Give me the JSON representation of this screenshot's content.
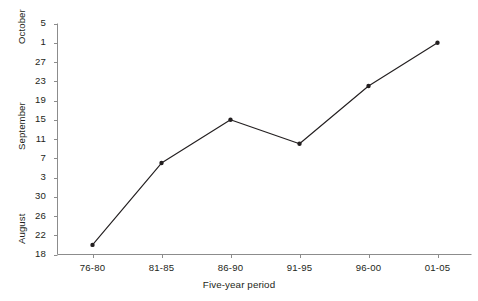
{
  "caption_clipped": "                                                                                                                    ",
  "axes": {
    "y_group_labels": [
      {
        "name": "October",
        "top": 44,
        "left": 16
      },
      {
        "name": "September",
        "top": 150,
        "left": 16
      },
      {
        "name": "August",
        "top": 244,
        "left": 16
      }
    ],
    "y_tick_labels": [
      "5",
      "1",
      "27",
      "23",
      "19",
      "15",
      "11",
      "7",
      "3",
      "30",
      "26",
      "22",
      "18"
    ],
    "x_tick_labels": [
      "76-80",
      "81-85",
      "86-90",
      "91-95",
      "96-00",
      "01-05"
    ],
    "x_title": "Five-year period",
    "y_title": ""
  },
  "chart_data": {
    "type": "line",
    "title": "",
    "subtitle": "",
    "xlabel": "Five-year period",
    "ylabel": "",
    "categories": [
      "76-80",
      "81-85",
      "86-90",
      "91-95",
      "96-00",
      "01-05"
    ],
    "y_tick_labels": [
      "5",
      "1",
      "27",
      "23",
      "19",
      "15",
      "11",
      "7",
      "3",
      "30",
      "26",
      "22",
      "18"
    ],
    "y_tick_values": [
      66,
      62,
      58,
      54,
      50,
      46,
      42,
      38,
      34,
      30,
      26,
      22,
      18
    ],
    "y_axis_note": "Day-of-year style date axis: 18-30 = August, 3-27 = September, 1-5 = October",
    "ylim": [
      18,
      66
    ],
    "values": [
      20,
      37,
      46,
      41,
      53,
      62
    ],
    "value_labels": [
      "20 August",
      "6 September",
      "15 September",
      "10 September",
      "22 September",
      "1 October"
    ],
    "series": [
      {
        "name": "Date",
        "values": [
          20,
          37,
          46,
          41,
          53,
          62
        ],
        "labels": [
          "20 August",
          "6 September",
          "15 September",
          "10 September",
          "22 September",
          "1 October"
        ]
      }
    ],
    "grid": false,
    "legend": false,
    "legend_position": "none",
    "marker": "filled-circle",
    "line_color": "#231f20",
    "marker_color": "#231f20",
    "axis_color": "#808080"
  },
  "colors": {
    "line": "#231f20",
    "marker": "#231f20",
    "axis": "#8c8c8c",
    "text": "#231f20",
    "background": "#ffffff"
  }
}
